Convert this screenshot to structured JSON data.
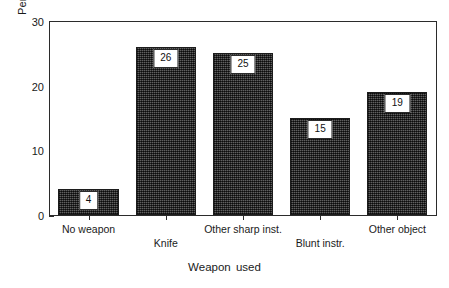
{
  "chart_data": {
    "type": "bar",
    "title": "",
    "xlabel": "Weapon used",
    "ylabel": "Per cent serious injuries",
    "categories": [
      "No weapon",
      "Knife",
      "Other sharp inst.",
      "Blunt instr.",
      "Other object"
    ],
    "values": [
      4,
      26,
      25,
      15,
      19
    ],
    "value_labels": [
      "4",
      "26",
      "25",
      "15",
      "19"
    ],
    "ylim": [
      0,
      30
    ],
    "yticks": [
      0,
      10,
      20,
      30
    ],
    "ytick_labels": [
      "0",
      "10",
      "20",
      "30"
    ],
    "grid": false,
    "legend": false,
    "category_label_rows": [
      0,
      1,
      0,
      1,
      0
    ],
    "bar_color": "#3a3a3a",
    "bar_edge_color": "#1c1c1c",
    "axis_color": "#2b2b2b",
    "label_box_background": "#ffffff"
  }
}
